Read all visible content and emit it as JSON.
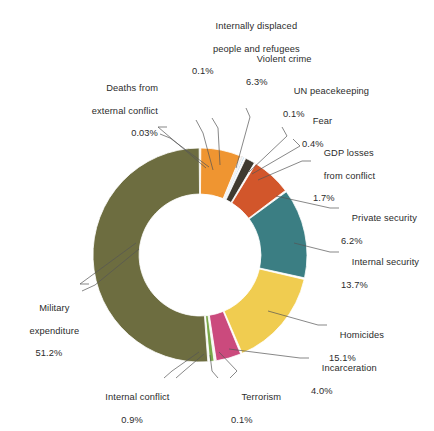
{
  "chart_data": {
    "type": "pie",
    "variant": "donut",
    "title": "",
    "subtitle": "",
    "xlabel": "",
    "ylabel": "",
    "legend_position": "none",
    "grid": false,
    "units": "percent",
    "total": 100.0,
    "start_angle_deg": 0,
    "direction": "clockwise",
    "categories": [
      "Violent crime",
      "Internally displaced people and refugees",
      "UN peacekeeping",
      "Fear",
      "GDP losses from conflict",
      "Private security",
      "Internal security",
      "Homicides",
      "Incarceration",
      "Terrorism",
      "Internal conflict",
      "Deaths from external conflict",
      "Military expenditure"
    ],
    "values": [
      6.3,
      0.1,
      0.1,
      0.4,
      1.7,
      6.2,
      13.7,
      15.1,
      4.0,
      0.1,
      0.9,
      0.03,
      51.2
    ],
    "value_labels": [
      "6.3%",
      "0.1%",
      "0.1%",
      "0.4%",
      "1.7%",
      "6.2%",
      "13.7%",
      "15.1%",
      "4.0%",
      "0.1%",
      "0.9%",
      "0.03%",
      "51.2%"
    ],
    "colors": [
      "#ef9531",
      "#4a4438",
      "#4a4438",
      "#6fa8d6",
      "#3f3a30",
      "#d2562b",
      "#3b7e83",
      "#f0cc50",
      "#cb4a7d",
      "#8f8f5a",
      "#7aa849",
      "#4a4438",
      "#6d6d40"
    ],
    "slices": [
      {
        "label": "Violent crime",
        "value": 6.3,
        "value_label": "6.3%",
        "color": "#ef9531"
      },
      {
        "label": "Internally displaced people and refugees",
        "value": 0.1,
        "value_label": "0.1%",
        "color": "#4a4438"
      },
      {
        "label": "UN peacekeeping",
        "value": 0.1,
        "value_label": "0.1%",
        "color": "#4a4438"
      },
      {
        "label": "Fear",
        "value": 0.4,
        "value_label": "0.4%",
        "color": "#6fa8d6"
      },
      {
        "label": "GDP losses from conflict",
        "value": 1.7,
        "value_label": "1.7%",
        "color": "#3f3a30"
      },
      {
        "label": "Private security",
        "value": 6.2,
        "value_label": "6.2%",
        "color": "#d2562b"
      },
      {
        "label": "Internal security",
        "value": 13.7,
        "value_label": "13.7%",
        "color": "#3b7e83"
      },
      {
        "label": "Homicides",
        "value": 15.1,
        "value_label": "15.1%",
        "color": "#f0cc50"
      },
      {
        "label": "Incarceration",
        "value": 4.0,
        "value_label": "4.0%",
        "color": "#cb4a7d"
      },
      {
        "label": "Terrorism",
        "value": 0.1,
        "value_label": "0.1%",
        "color": "#8f8f5a"
      },
      {
        "label": "Internal conflict",
        "value": 0.9,
        "value_label": "0.9%",
        "color": "#7aa849"
      },
      {
        "label": "Deaths from external conflict",
        "value": 0.03,
        "value_label": "0.03%",
        "color": "#4a4438"
      },
      {
        "label": "Military expenditure",
        "value": 51.2,
        "value_label": "51.2%",
        "color": "#6d6d40"
      }
    ]
  },
  "labels": {
    "internally_displaced": {
      "line1": "Internally displaced",
      "line2": "people and refugees",
      "pct": "0.1%"
    },
    "violent_crime": {
      "line1": "Violent crime",
      "pct": "6.3%"
    },
    "un_peacekeeping": {
      "line1": "UN peacekeeping",
      "pct": "0.1%"
    },
    "fear": {
      "line1": "Fear",
      "pct": "0.4%"
    },
    "gdp_losses": {
      "line1": "GDP losses",
      "line2": "from conflict",
      "pct": "1.7%"
    },
    "private_security": {
      "line1": "Private security",
      "pct": "6.2%"
    },
    "internal_security": {
      "line1": "Internal security",
      "pct": "13.7%"
    },
    "homicides": {
      "line1": "Homicides",
      "pct": "15.1%"
    },
    "incarceration": {
      "line1": "Incarceration",
      "pct": "4.0%"
    },
    "terrorism": {
      "line1": "Terrorism",
      "pct": "0.1%"
    },
    "internal_conflict": {
      "line1": "Internal conflict",
      "pct": "0.9%"
    },
    "deaths_external": {
      "line1": "Deaths from",
      "line2": "external conflict",
      "pct": "0.03%"
    },
    "military_expenditure": {
      "line1": "Military",
      "line2": "expenditure",
      "pct": "51.2%"
    }
  }
}
